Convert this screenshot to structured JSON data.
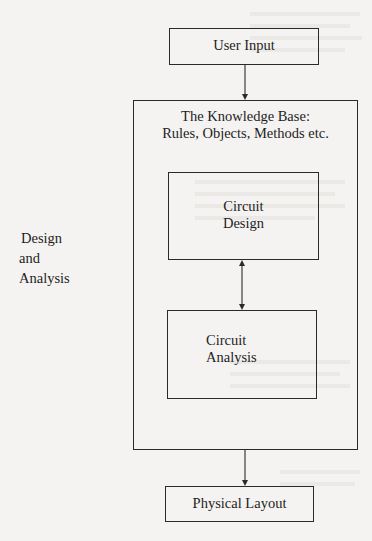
{
  "diagram": {
    "type": "flowchart",
    "nodes": {
      "user_input": {
        "label": "User Input"
      },
      "knowledge_base": {
        "label_line1": "The Knowledge Base:",
        "label_line2": "Rules, Objects, Methods etc."
      },
      "circuit_design": {
        "label_line1": "Circuit",
        "label_line2": "Design"
      },
      "circuit_analysis": {
        "label_line1": "Circuit",
        "label_line2": "Analysis"
      },
      "physical_layout": {
        "label": "Physical Layout"
      }
    },
    "side_label": {
      "line1": "Design",
      "line2": "and",
      "line3": "Analysis"
    },
    "edges": [
      {
        "from": "user_input",
        "to": "knowledge_base",
        "type": "arrow"
      },
      {
        "from": "circuit_design",
        "to": "circuit_analysis",
        "type": "bidirectional-arrow"
      },
      {
        "from": "knowledge_base",
        "to": "physical_layout",
        "type": "arrow"
      }
    ],
    "colors": {
      "line": "#2a2a2a",
      "paper": "#f4f3f1",
      "text": "#1e1e1e"
    }
  }
}
